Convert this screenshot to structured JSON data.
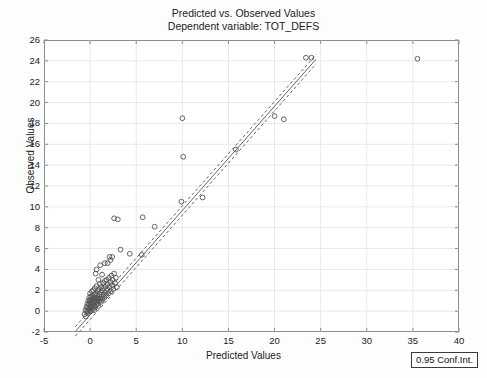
{
  "chart_data": {
    "type": "scatter",
    "title": "Predicted vs. Observed Values",
    "subtitle": "Dependent variable: TOT_DEFS",
    "xlabel": "Predicted Values",
    "ylabel": "Observed Values",
    "xlim": [
      -5,
      40
    ],
    "ylim": [
      -2,
      26
    ],
    "xticks": [
      "-5",
      "0",
      "5",
      "10",
      "15",
      "20",
      "25",
      "30",
      "35",
      "40"
    ],
    "yticks": [
      "-2",
      "0",
      "2",
      "4",
      "6",
      "8",
      "10",
      "12",
      "14",
      "16",
      "18",
      "20",
      "22",
      "24",
      "26"
    ],
    "xtick_values": [
      -5,
      0,
      5,
      10,
      15,
      20,
      25,
      30,
      35,
      40
    ],
    "ytick_values": [
      -2,
      0,
      2,
      4,
      6,
      8,
      10,
      12,
      14,
      16,
      18,
      20,
      22,
      24,
      26
    ],
    "grid": true,
    "legend": "0.95 Conf.Int.",
    "legend_position": "below-right-outside",
    "marker": "open-circle",
    "marker_color": "#555555",
    "line_color": "#666666",
    "fit_line": {
      "style": "solid",
      "slope": 1.0,
      "intercept": -0.35,
      "x_start": -1.6,
      "x_end": 24.5
    },
    "conf_band": {
      "style": "dashed",
      "level": 0.95,
      "offset": 0.45
    },
    "points": [
      [
        -0.6,
        -0.3
      ],
      [
        -0.5,
        0.1
      ],
      [
        -0.45,
        -0.5
      ],
      [
        -0.4,
        0.4
      ],
      [
        -0.35,
        0.0
      ],
      [
        -0.3,
        0.7
      ],
      [
        -0.3,
        -0.2
      ],
      [
        -0.25,
        0.3
      ],
      [
        -0.2,
        1.0
      ],
      [
        -0.2,
        0.0
      ],
      [
        -0.15,
        0.6
      ],
      [
        -0.1,
        1.3
      ],
      [
        -0.1,
        0.2
      ],
      [
        -0.05,
        0.9
      ],
      [
        0.0,
        0.0
      ],
      [
        0.0,
        0.5
      ],
      [
        0.0,
        1.1
      ],
      [
        0.0,
        1.7
      ],
      [
        0.05,
        0.3
      ],
      [
        0.05,
        0.8
      ],
      [
        0.1,
        1.4
      ],
      [
        0.1,
        0.0
      ],
      [
        0.15,
        0.6
      ],
      [
        0.15,
        1.1
      ],
      [
        0.2,
        1.9
      ],
      [
        0.2,
        0.4
      ],
      [
        0.25,
        0.9
      ],
      [
        0.25,
        1.5
      ],
      [
        0.3,
        0.2
      ],
      [
        0.3,
        0.7
      ],
      [
        0.35,
        1.2
      ],
      [
        0.35,
        2.0
      ],
      [
        0.4,
        0.5
      ],
      [
        0.4,
        1.0
      ],
      [
        0.45,
        1.6
      ],
      [
        0.45,
        0.1
      ],
      [
        0.5,
        0.8
      ],
      [
        0.5,
        1.3
      ],
      [
        0.5,
        2.2
      ],
      [
        0.55,
        0.4
      ],
      [
        0.6,
        1.0
      ],
      [
        0.6,
        1.7
      ],
      [
        0.65,
        0.6
      ],
      [
        0.65,
        1.2
      ],
      [
        0.7,
        2.4
      ],
      [
        0.7,
        0.9
      ],
      [
        0.75,
        1.5
      ],
      [
        0.8,
        0.7
      ],
      [
        0.8,
        1.1
      ],
      [
        0.85,
        1.9
      ],
      [
        0.9,
        1.3
      ],
      [
        0.9,
        0.5
      ],
      [
        0.95,
        2.1
      ],
      [
        1.0,
        1.0
      ],
      [
        1.0,
        1.6
      ],
      [
        1.05,
        2.6
      ],
      [
        1.1,
        1.2
      ],
      [
        1.15,
        1.8
      ],
      [
        1.2,
        0.9
      ],
      [
        1.2,
        2.3
      ],
      [
        1.25,
        1.4
      ],
      [
        1.3,
        2.0
      ],
      [
        1.35,
        1.1
      ],
      [
        1.4,
        2.7
      ],
      [
        1.45,
        1.6
      ],
      [
        1.5,
        2.2
      ],
      [
        1.55,
        1.3
      ],
      [
        1.6,
        2.9
      ],
      [
        1.65,
        1.8
      ],
      [
        1.7,
        2.4
      ],
      [
        1.75,
        1.5
      ],
      [
        1.8,
        3.0
      ],
      [
        1.85,
        2.1
      ],
      [
        1.9,
        2.6
      ],
      [
        2.0,
        1.7
      ],
      [
        2.05,
        3.2
      ],
      [
        2.1,
        2.3
      ],
      [
        2.2,
        2.8
      ],
      [
        2.25,
        1.9
      ],
      [
        2.3,
        3.4
      ],
      [
        2.4,
        2.5
      ],
      [
        2.45,
        3.0
      ],
      [
        2.5,
        2.1
      ],
      [
        2.6,
        3.6
      ],
      [
        2.7,
        2.7
      ],
      [
        2.8,
        3.2
      ],
      [
        2.9,
        2.3
      ],
      [
        0.6,
        3.6
      ],
      [
        0.7,
        4.0
      ],
      [
        0.9,
        3.0
      ],
      [
        1.1,
        4.4
      ],
      [
        1.3,
        3.5
      ],
      [
        1.6,
        4.6
      ],
      [
        1.9,
        4.6
      ],
      [
        2.1,
        5.2
      ],
      [
        2.2,
        4.9
      ],
      [
        2.4,
        5.2
      ],
      [
        2.6,
        8.9
      ],
      [
        3.0,
        8.8
      ],
      [
        3.3,
        5.9
      ],
      [
        4.3,
        5.5
      ],
      [
        5.6,
        5.4
      ],
      [
        5.7,
        9.0
      ],
      [
        7.0,
        8.1
      ],
      [
        9.9,
        10.5
      ],
      [
        10.0,
        18.5
      ],
      [
        10.1,
        14.8
      ],
      [
        12.2,
        10.9
      ],
      [
        15.8,
        15.5
      ],
      [
        20.0,
        18.7
      ],
      [
        21.0,
        18.4
      ],
      [
        23.4,
        24.3
      ],
      [
        24.0,
        24.3
      ],
      [
        35.5,
        24.2
      ]
    ]
  }
}
